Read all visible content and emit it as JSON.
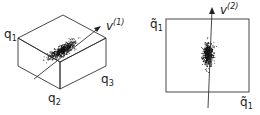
{
  "left_panel": {
    "labels": {
      "q1": "q",
      "q1_sub": "1",
      "q2": "q",
      "q2_sub": "2",
      "q3": "q",
      "q3_sub": "3",
      "v": "v",
      "v_sup": "(1)"
    }
  },
  "right_panel": {
    "labels": {
      "q1_top": "q̃",
      "q1_top_sub": "1",
      "q1_bottom": "q̃",
      "q1_bottom_sub": "1",
      "v": "v",
      "v_sup": "(2)"
    }
  },
  "colors": {
    "line": "#333333",
    "dots": "#111111"
  }
}
